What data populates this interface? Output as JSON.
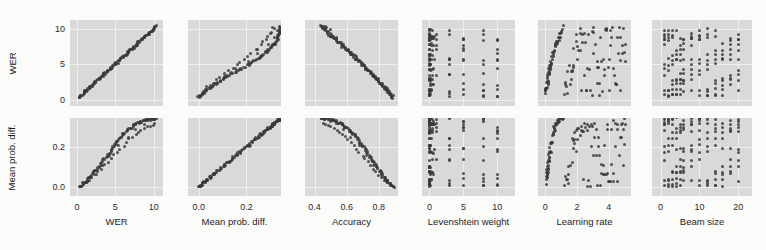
{
  "figure": {
    "type": "scatter-matrix",
    "background": "#fbfbfa",
    "panel_background": "#d9d9d9",
    "point_color": "#3a3a3a",
    "rows": 2,
    "cols": 6
  },
  "chart_data": {
    "type": "scatter",
    "title": "",
    "layout": "pair-plot grid, 2 rows x 6 columns, shared y per row, shared x per column",
    "grid": true,
    "legend": null,
    "row_variables": [
      {
        "name": "WER",
        "ylabel": "WER",
        "ylim": [
          -0.9,
          11.2
        ],
        "yticks": [
          0,
          5,
          10
        ],
        "ytick_labels": [
          "0",
          "5",
          "10"
        ]
      },
      {
        "name": "Mean prob. diff.",
        "ylabel": "Mean prob. diff.",
        "ylim": [
          -0.045,
          0.345
        ],
        "yticks": [
          0.0,
          0.2
        ],
        "ytick_labels": [
          "0.0",
          "0.2"
        ]
      }
    ],
    "column_variables": [
      {
        "name": "WER",
        "xlabel": "WER",
        "xlim": [
          -0.9,
          11.2
        ],
        "xticks": [
          0,
          5,
          10
        ],
        "xtick_labels": [
          "0",
          "5",
          "10"
        ]
      },
      {
        "name": "Mean prob. diff.",
        "xlabel": "Mean prob. diff.",
        "xlim": [
          -0.045,
          0.345
        ],
        "xticks": [
          0.0,
          0.2
        ],
        "xtick_labels": [
          "0.0",
          "0.2"
        ]
      },
      {
        "name": "Accuracy",
        "xlabel": "Accuracy",
        "xlim": [
          0.34,
          0.92
        ],
        "xticks": [
          0.4,
          0.6,
          0.8
        ],
        "xtick_labels": [
          "0.4",
          "0.6",
          "0.8"
        ]
      },
      {
        "name": "Levenshtein weight",
        "xlabel": "Levenshtein weight",
        "xlim": [
          -1.1,
          12.6
        ],
        "xticks": [
          0,
          5,
          10
        ],
        "xtick_labels": [
          "0",
          "5",
          "10"
        ]
      },
      {
        "name": "Learning rate",
        "xlabel": "Learning rate",
        "xlim": [
          -0.45,
          5.4
        ],
        "xticks": [
          0,
          2,
          4
        ],
        "xtick_labels": [
          "0",
          "2",
          "4"
        ]
      },
      {
        "name": "Beam size",
        "xlabel": "Beam size",
        "xlim": [
          -2.2,
          23.5
        ],
        "xticks": [
          0,
          10,
          20
        ],
        "xtick_labels": [
          "0",
          "10",
          "20"
        ]
      }
    ],
    "panels": [
      {
        "row": 0,
        "col": 0,
        "x_var": "WER",
        "y_var": "WER",
        "relationship": "perfect positive identity line",
        "n_points": 140
      },
      {
        "row": 0,
        "col": 1,
        "x_var": "Mean prob. diff.",
        "y_var": "WER",
        "relationship": "strong positive, slightly sigmoid",
        "n_points": 140
      },
      {
        "row": 0,
        "col": 2,
        "x_var": "Accuracy",
        "y_var": "WER",
        "relationship": "strong negative, slightly convex",
        "n_points": 140
      },
      {
        "row": 0,
        "col": 3,
        "x_var": "Levenshtein weight",
        "y_var": "WER",
        "relationship": "discrete columns, weak/no trend",
        "n_points": 140
      },
      {
        "row": 0,
        "col": 4,
        "x_var": "Learning rate",
        "y_var": "WER",
        "relationship": "rises steeply then plateaus (saturating)",
        "n_points": 140
      },
      {
        "row": 0,
        "col": 5,
        "x_var": "Beam size",
        "y_var": "WER",
        "relationship": "discrete columns, no trend",
        "n_points": 140
      },
      {
        "row": 1,
        "col": 0,
        "x_var": "WER",
        "y_var": "Mean prob. diff.",
        "relationship": "strong positive, slightly sigmoid",
        "n_points": 140
      },
      {
        "row": 1,
        "col": 1,
        "x_var": "Mean prob. diff.",
        "y_var": "Mean prob. diff.",
        "relationship": "perfect positive identity line",
        "n_points": 140
      },
      {
        "row": 1,
        "col": 2,
        "x_var": "Accuracy",
        "y_var": "Mean prob. diff.",
        "relationship": "strong negative, slightly convex",
        "n_points": 140
      },
      {
        "row": 1,
        "col": 3,
        "x_var": "Levenshtein weight",
        "y_var": "Mean prob. diff.",
        "relationship": "discrete columns, weak/no trend",
        "n_points": 140
      },
      {
        "row": 1,
        "col": 4,
        "x_var": "Learning rate",
        "y_var": "Mean prob. diff.",
        "relationship": "rises steeply then plateaus (saturating)",
        "n_points": 140
      },
      {
        "row": 1,
        "col": 5,
        "x_var": "Beam size",
        "y_var": "Mean prob. diff.",
        "relationship": "discrete columns, no trend",
        "n_points": 140
      }
    ],
    "samples": {
      "wer": [
        0.3,
        0.45,
        0.62,
        0.71,
        0.88,
        0.95,
        1.05,
        1.18,
        1.22,
        1.35,
        1.44,
        1.55,
        1.63,
        1.72,
        1.8,
        1.92,
        2.0,
        2.12,
        2.24,
        2.33,
        2.41,
        2.55,
        2.62,
        2.74,
        2.85,
        2.93,
        3.05,
        3.14,
        3.22,
        3.35,
        3.44,
        3.52,
        3.63,
        3.75,
        3.84,
        3.92,
        4.03,
        4.12,
        4.24,
        4.33,
        4.41,
        4.52,
        4.63,
        4.75,
        4.84,
        4.92,
        5.03,
        5.12,
        5.21,
        5.33,
        5.44,
        5.55,
        5.62,
        5.74,
        5.85,
        5.93,
        6.04,
        6.12,
        6.23,
        6.34,
        6.42,
        6.53,
        6.64,
        6.72,
        6.84,
        6.93,
        7.02,
        7.13,
        7.24,
        7.33,
        7.44,
        7.52,
        7.63,
        7.72,
        7.84,
        7.93,
        8.02,
        8.14,
        8.23,
        8.34,
        8.42,
        8.53,
        8.62,
        8.74,
        8.83,
        8.92,
        9.03,
        9.14,
        9.22,
        9.33,
        9.42,
        9.53,
        9.62,
        9.74,
        9.83,
        9.92,
        10.02,
        10.12,
        10.21,
        10.32,
        0.38,
        0.55,
        0.8,
        1.1,
        1.4,
        1.68,
        2.05,
        2.45,
        2.8,
        3.2,
        3.6,
        4.0,
        4.45,
        4.85,
        5.25,
        5.65,
        6.05,
        6.45,
        6.85,
        7.25,
        7.65,
        8.05,
        8.45,
        8.85,
        9.25,
        9.6,
        9.95,
        10.15,
        0.52,
        1.25,
        2.18,
        3.3,
        4.4,
        5.5,
        6.6,
        7.7,
        8.8,
        9.7,
        10.05,
        10.25
      ],
      "mean_prob_diff": [
        0.0,
        0.004,
        0.009,
        0.013,
        0.018,
        0.02,
        0.024,
        0.028,
        0.03,
        0.034,
        0.038,
        0.043,
        0.046,
        0.05,
        0.054,
        0.058,
        0.062,
        0.067,
        0.072,
        0.076,
        0.08,
        0.086,
        0.09,
        0.096,
        0.101,
        0.105,
        0.111,
        0.116,
        0.12,
        0.126,
        0.131,
        0.135,
        0.141,
        0.147,
        0.152,
        0.156,
        0.162,
        0.167,
        0.173,
        0.178,
        0.182,
        0.188,
        0.193,
        0.199,
        0.204,
        0.208,
        0.213,
        0.218,
        0.222,
        0.228,
        0.233,
        0.238,
        0.241,
        0.247,
        0.252,
        0.256,
        0.26,
        0.264,
        0.268,
        0.272,
        0.275,
        0.279,
        0.283,
        0.286,
        0.29,
        0.293,
        0.296,
        0.299,
        0.302,
        0.305,
        0.308,
        0.31,
        0.313,
        0.315,
        0.318,
        0.32,
        0.322,
        0.324,
        0.326,
        0.328,
        0.329,
        0.331,
        0.332,
        0.334,
        0.335,
        0.336,
        0.337,
        0.338,
        0.339,
        0.34,
        0.34,
        0.341,
        0.341,
        0.342,
        0.342,
        0.343,
        0.343,
        0.343,
        0.344,
        0.344,
        0.002,
        0.006,
        0.012,
        0.019,
        0.027,
        0.035,
        0.048,
        0.062,
        0.076,
        0.092,
        0.108,
        0.124,
        0.142,
        0.158,
        0.174,
        0.19,
        0.206,
        0.221,
        0.236,
        0.249,
        0.261,
        0.272,
        0.282,
        0.291,
        0.299,
        0.306,
        0.312,
        0.317,
        0.005,
        0.031,
        0.065,
        0.11,
        0.158,
        0.206,
        0.25,
        0.288,
        0.315,
        0.33,
        0.338,
        0.342
      ],
      "accuracy": [
        0.89,
        0.884,
        0.878,
        0.874,
        0.869,
        0.866,
        0.862,
        0.858,
        0.856,
        0.851,
        0.847,
        0.843,
        0.84,
        0.836,
        0.833,
        0.829,
        0.825,
        0.821,
        0.816,
        0.812,
        0.809,
        0.804,
        0.8,
        0.795,
        0.791,
        0.787,
        0.782,
        0.778,
        0.775,
        0.77,
        0.766,
        0.762,
        0.757,
        0.752,
        0.748,
        0.744,
        0.739,
        0.735,
        0.73,
        0.726,
        0.722,
        0.717,
        0.712,
        0.707,
        0.703,
        0.699,
        0.694,
        0.69,
        0.686,
        0.681,
        0.676,
        0.671,
        0.668,
        0.662,
        0.657,
        0.653,
        0.648,
        0.644,
        0.639,
        0.634,
        0.63,
        0.625,
        0.62,
        0.616,
        0.61,
        0.606,
        0.601,
        0.596,
        0.591,
        0.586,
        0.581,
        0.577,
        0.572,
        0.567,
        0.561,
        0.556,
        0.552,
        0.546,
        0.541,
        0.536,
        0.532,
        0.526,
        0.522,
        0.516,
        0.511,
        0.507,
        0.501,
        0.496,
        0.492,
        0.486,
        0.482,
        0.477,
        0.472,
        0.466,
        0.461,
        0.457,
        0.452,
        0.447,
        0.442,
        0.437,
        0.887,
        0.88,
        0.87,
        0.857,
        0.844,
        0.833,
        0.817,
        0.8,
        0.785,
        0.768,
        0.751,
        0.734,
        0.715,
        0.697,
        0.68,
        0.662,
        0.644,
        0.626,
        0.608,
        0.59,
        0.572,
        0.554,
        0.536,
        0.518,
        0.5,
        0.484,
        0.468,
        0.459,
        0.882,
        0.853,
        0.814,
        0.767,
        0.72,
        0.674,
        0.627,
        0.58,
        0.534,
        0.496,
        0.481,
        0.471
      ],
      "levenshtein_weight": [
        0.0,
        0.3,
        0.5,
        0.0,
        1.0,
        0.2,
        0.0,
        3.0,
        0.4,
        0.0,
        5.0,
        0.6,
        0.0,
        0.1,
        8.0,
        0.0,
        0.8,
        10.0,
        0.0,
        0.3,
        0.0,
        5.0,
        0.1,
        0.0,
        3.0,
        0.6,
        0.0,
        10.0,
        0.2,
        0.0,
        1.0,
        0.0,
        8.0,
        0.4,
        0.0,
        0.1,
        5.0,
        0.0,
        3.0,
        0.7,
        0.0,
        10.0,
        0.2,
        0.0,
        0.5,
        0.0,
        8.0,
        0.3,
        0.0,
        1.0,
        0.0,
        5.0,
        0.1,
        0.0,
        3.0,
        0.0,
        10.0,
        0.4,
        0.0,
        0.2,
        0.0,
        8.0,
        0.6,
        0.0,
        5.0,
        0.0,
        0.1,
        3.0,
        0.0,
        10.0,
        0.3,
        0.0,
        1.0,
        0.0,
        8.0,
        0.5,
        0.0,
        5.0,
        0.2,
        0.0,
        3.0,
        0.0,
        10.0,
        0.1,
        0.0,
        0.4,
        0.0,
        8.0,
        0.0,
        5.0,
        0.6,
        0.0,
        3.0,
        0.0,
        10.0,
        0.2,
        0.0,
        1.0,
        0.0,
        0.5,
        0.0,
        0.3,
        5.0,
        0.0,
        8.0,
        0.1,
        3.0,
        0.0,
        10.0,
        0.4,
        0.0,
        5.0,
        0.0,
        8.0,
        0.2,
        0.0,
        3.0,
        10.0,
        0.0,
        0.6,
        5.0,
        0.0,
        8.0,
        0.0,
        3.0,
        10.0,
        0.1,
        0.0,
        0.0,
        5.0,
        0.3,
        8.0,
        0.0,
        3.0,
        10.0,
        0.0,
        5.0,
        0.2,
        8.0,
        0.0,
        10.0
      ],
      "learning_rate": [
        0.05,
        0.08,
        0.1,
        0.12,
        0.15,
        0.18,
        0.2,
        0.22,
        0.25,
        0.28,
        0.3,
        0.35,
        0.38,
        0.42,
        0.45,
        0.5,
        0.55,
        0.6,
        0.65,
        0.7,
        0.75,
        0.8,
        0.85,
        0.9,
        0.95,
        1.0,
        1.1,
        1.2,
        1.3,
        1.4,
        1.5,
        1.6,
        1.7,
        1.8,
        1.9,
        2.0,
        2.1,
        2.2,
        2.3,
        2.4,
        2.5,
        2.6,
        2.7,
        2.8,
        2.9,
        3.0,
        3.1,
        3.2,
        3.3,
        3.4,
        3.5,
        3.6,
        3.7,
        3.8,
        3.9,
        4.0,
        4.1,
        4.2,
        4.3,
        4.4,
        4.5,
        4.6,
        4.7,
        4.8,
        4.9,
        5.0,
        0.06,
        0.11,
        0.16,
        0.21,
        0.26,
        0.32,
        0.4,
        0.48,
        0.58,
        0.68,
        0.78,
        0.88,
        0.98,
        1.15,
        1.35,
        1.55,
        1.75,
        1.95,
        2.15,
        2.35,
        2.55,
        2.75,
        2.95,
        3.15,
        3.35,
        3.55,
        3.75,
        3.95,
        4.15,
        4.35,
        4.55,
        4.75,
        4.95,
        0.07,
        0.14,
        0.24,
        0.36,
        0.52,
        0.72,
        0.92,
        1.25,
        1.65,
        2.05,
        2.45,
        2.85,
        3.25,
        3.65,
        4.05,
        4.45,
        4.85,
        0.09,
        0.19,
        0.33,
        0.55,
        0.85,
        1.45,
        2.25,
        3.05,
        3.85,
        4.65,
        0.13,
        0.29,
        0.62,
        1.05,
        1.85,
        2.65,
        3.45,
        4.25,
        4.95,
        5.0,
        0.17,
        0.44,
        1.75,
        3.35
      ],
      "beam_size": [
        1,
        2,
        3,
        4,
        5,
        6,
        8,
        10,
        12,
        14,
        16,
        18,
        20,
        1,
        2,
        3,
        4,
        5,
        6,
        8,
        10,
        12,
        14,
        16,
        18,
        20,
        1,
        2,
        3,
        4,
        5,
        6,
        8,
        10,
        12,
        14,
        16,
        18,
        20,
        1,
        2,
        3,
        4,
        5,
        6,
        8,
        10,
        12,
        14,
        16,
        18,
        20,
        1,
        2,
        3,
        4,
        5,
        6,
        8,
        10,
        12,
        14,
        16,
        18,
        20,
        1,
        2,
        3,
        4,
        5,
        6,
        8,
        10,
        12,
        14,
        16,
        18,
        20,
        1,
        2,
        3,
        4,
        5,
        6,
        8,
        10,
        12,
        14,
        16,
        18,
        20,
        1,
        2,
        3,
        4,
        5,
        6,
        8,
        10,
        12,
        14,
        16,
        18,
        20,
        1,
        2,
        3,
        4,
        5,
        6,
        8,
        10,
        12,
        14,
        16,
        18,
        20,
        1,
        2,
        3,
        4,
        5,
        6,
        8,
        10,
        12,
        14,
        16,
        18,
        20,
        1,
        2,
        3,
        4,
        5,
        6,
        8,
        10,
        12,
        14
      ]
    }
  }
}
